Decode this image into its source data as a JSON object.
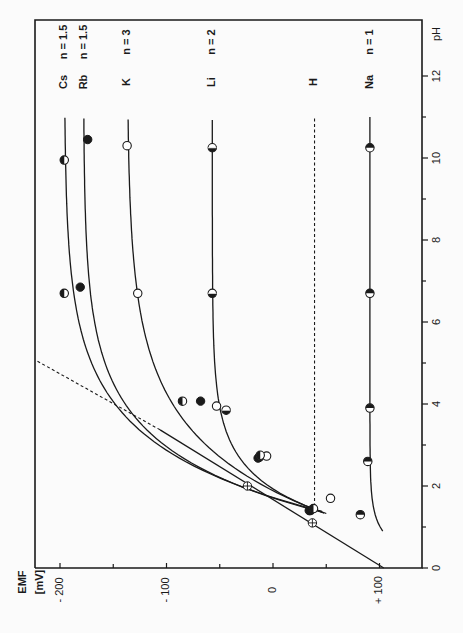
{
  "chart_data": {
    "type": "line",
    "orientation": "rotated-90-ccw",
    "title": "",
    "xlabel": "pH",
    "ylabel": "EMF [mV]",
    "x_axis": {
      "label": "pH",
      "ticks": [
        0,
        2,
        4,
        6,
        8,
        10,
        12
      ],
      "minor_ticks": [
        1,
        3,
        5,
        7,
        9,
        11
      ],
      "range": [
        0,
        13.5
      ]
    },
    "y_axis": {
      "label_line1": "EMF",
      "label_line2": "[mV]",
      "ticks": [
        -200,
        -100,
        0,
        100
      ],
      "tick_labels": [
        "- 200",
        "- 100",
        "0",
        "+ 100"
      ],
      "minor_ticks": [
        -150,
        -50,
        50
      ],
      "range": [
        -223,
        140
      ],
      "inverted": true
    },
    "grid": false,
    "series": [
      {
        "name": "Cs",
        "n_label": "n = 1.5",
        "marker": "half-filled-bottom",
        "plateau": -196,
        "points": [
          [
            4.07,
            -85
          ],
          [
            6.7,
            -196
          ],
          [
            9.95,
            -196
          ]
        ]
      },
      {
        "name": "Rb",
        "n_label": "n = 1.5",
        "marker": "filled",
        "plateau": -178,
        "points": [
          [
            4.07,
            -68
          ],
          [
            6.85,
            -181
          ],
          [
            10.45,
            -174
          ]
        ]
      },
      {
        "name": "K",
        "n_label": "n = 3",
        "marker": "open",
        "plateau": -137,
        "points": [
          [
            1.7,
            54
          ],
          [
            2.73,
            -6
          ],
          [
            3.95,
            -53
          ],
          [
            6.7,
            -127
          ],
          [
            10.3,
            -137
          ]
        ]
      },
      {
        "name": "Li",
        "n_label": "n = 2",
        "marker": "half-filled-center",
        "plateau": -57,
        "points": [
          [
            1.4,
            35
          ],
          [
            2.7,
            -13
          ],
          [
            3.85,
            -44
          ],
          [
            6.7,
            -57
          ],
          [
            10.25,
            -57
          ]
        ]
      },
      {
        "name": "H",
        "n_label": "",
        "marker": "none",
        "style": "dashed",
        "plateau": 39,
        "points": []
      },
      {
        "name": "Na",
        "n_label": "n = 1",
        "marker": "half-filled-top",
        "plateau": 91,
        "points": [
          [
            1.3,
            82
          ],
          [
            2.6,
            89
          ],
          [
            3.9,
            91
          ],
          [
            6.7,
            91
          ],
          [
            10.25,
            91
          ]
        ]
      },
      {
        "name": "Nernst reference",
        "n_label": "",
        "marker": "crossed-circle",
        "style": "solid-then-dashed",
        "line": {
          "from": [
            0,
            104
          ],
          "solid_until": [
            3.37,
            -106
          ],
          "dashed_to": [
            5.07,
            -223
          ]
        },
        "points": [
          [
            1.1,
            37
          ],
          [
            2.0,
            -24
          ]
        ]
      }
    ],
    "low_ph_cluster": [
      [
        2.7,
        -13
      ],
      [
        1.4,
        35
      ]
    ]
  },
  "labels": {
    "ph_axis": "pH",
    "emf_line1": "EMF",
    "emf_line2": "[mV]",
    "ph_ticks": [
      "0",
      "2",
      "4",
      "6",
      "8",
      "10",
      "12"
    ],
    "emf_ticks": [
      "- 200",
      "- 100",
      "0",
      "+ 100"
    ],
    "series_names": [
      "Cs",
      "Rb",
      "K",
      "Li",
      "H",
      "Na"
    ],
    "series_n": [
      "n = 1.5",
      "n = 1.5",
      "n = 3",
      "n = 2",
      "",
      "n = 1"
    ]
  },
  "colors": {
    "ink": "#1a1a1a",
    "paper": "#fbfbfb"
  }
}
